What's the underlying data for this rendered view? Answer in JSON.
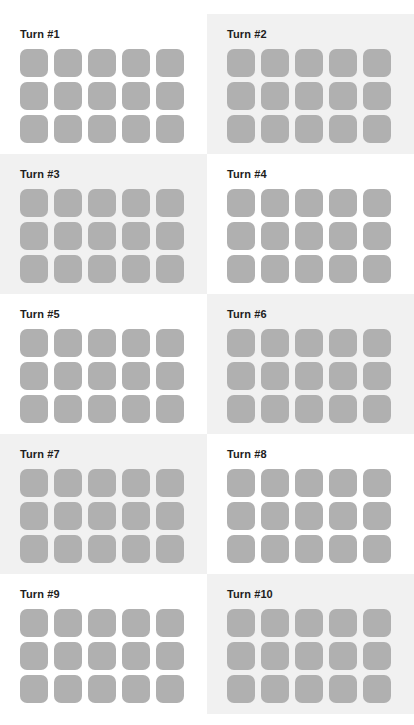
{
  "board": {
    "columns": 2,
    "rows": 5,
    "grid_columns": 5,
    "grid_rows": 3,
    "colors": {
      "tile": "#b0b0b0",
      "panel_background": "#ffffff",
      "panel_background_shaded": "#f1f1f1",
      "label_text": "#1d1d1d"
    },
    "panels": [
      {
        "label": "Turn #1",
        "shaded": false,
        "tiles": 15
      },
      {
        "label": "Turn #2",
        "shaded": true,
        "tiles": 15
      },
      {
        "label": "Turn #3",
        "shaded": true,
        "tiles": 15
      },
      {
        "label": "Turn #4",
        "shaded": false,
        "tiles": 15
      },
      {
        "label": "Turn #5",
        "shaded": false,
        "tiles": 15
      },
      {
        "label": "Turn #6",
        "shaded": true,
        "tiles": 15
      },
      {
        "label": "Turn #7",
        "shaded": true,
        "tiles": 15
      },
      {
        "label": "Turn #8",
        "shaded": false,
        "tiles": 15
      },
      {
        "label": "Turn #9",
        "shaded": false,
        "tiles": 15
      },
      {
        "label": "Turn #10",
        "shaded": true,
        "tiles": 15
      }
    ]
  }
}
